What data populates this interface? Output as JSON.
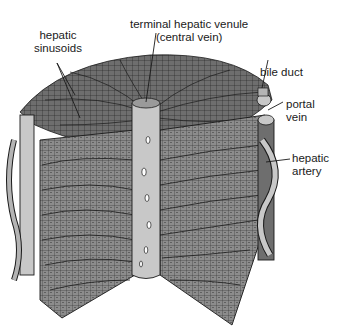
{
  "diagram": {
    "labels": {
      "hepatic_sinusoids": [
        "hepatic",
        "sinusoids"
      ],
      "terminal_hepatic_venule": [
        "terminal hepatic venule",
        "(central vein)"
      ],
      "bile_duct": "bile duct",
      "portal_vein": [
        "portal",
        "vein"
      ],
      "hepatic_artery": [
        "hepatic",
        "artery"
      ]
    },
    "colors": {
      "tissue_dark": "#6e6e6e",
      "tissue_mid": "#8c8c8c",
      "tissue_light": "#b4b4b4",
      "vessel_light": "#c8c8c8",
      "line": "#1a1a1a",
      "background": "#ffffff"
    }
  }
}
